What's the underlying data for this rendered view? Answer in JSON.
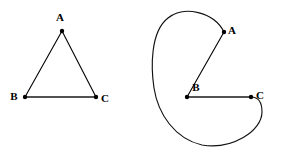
{
  "figure": {
    "background_color": "#ffffff",
    "stroke_color": "#000000",
    "caption": "",
    "panels": [
      {
        "id": "left-panel",
        "name": "triangle-graph",
        "description": "Triangle with straight edges",
        "vertices": [
          {
            "id": "A",
            "label": "A",
            "x": 62,
            "y": 31,
            "label_x": 60,
            "label_y": 18
          },
          {
            "id": "B",
            "label": "B",
            "x": 25,
            "y": 97,
            "label_x": 14,
            "label_y": 97
          },
          {
            "id": "C",
            "label": "C",
            "x": 96,
            "y": 97,
            "label_x": 105,
            "label_y": 99
          }
        ],
        "edges": [
          {
            "from": "A",
            "to": "B",
            "style": "straight"
          },
          {
            "from": "A",
            "to": "C",
            "style": "straight"
          },
          {
            "from": "B",
            "to": "C",
            "style": "straight"
          }
        ]
      },
      {
        "id": "right-panel",
        "name": "curved-graph",
        "description": "Same triangle drawn with two curved edges",
        "vertices": [
          {
            "id": "A",
            "label": "A",
            "x": 224,
            "y": 32,
            "label_x": 232,
            "label_y": 31
          },
          {
            "id": "B",
            "label": "B",
            "x": 187,
            "y": 97,
            "label_x": 196,
            "label_y": 88
          },
          {
            "id": "C",
            "label": "C",
            "x": 251,
            "y": 97,
            "label_x": 260,
            "label_y": 96
          }
        ],
        "edges": [
          {
            "from": "A",
            "to": "B",
            "style": "straight"
          },
          {
            "from": "B",
            "to": "C",
            "style": "straight"
          },
          {
            "from": "A",
            "to": "C",
            "style": "curved-loop"
          }
        ]
      }
    ]
  },
  "paths": {
    "left_AB": "M 62 31 L 25 97",
    "left_AC": "M 62 31 L 96 97",
    "left_BC": "M 25 97 L 96 97",
    "right_AB": "M 224 32 L 187 97",
    "right_BC": "M 187 97 L 251 97",
    "right_AC_curve": "M 224 32 C 214 12 184 5 168 18 C 150 32 151 68 154 88 C 158 114 175 139 202 145 C 232 150 262 131 262 112 C 262 102 258 97 251 97"
  },
  "geometry": {
    "vertex_dot_radius": 2.2,
    "label_font_size_px": 11,
    "canvas_width": 282,
    "canvas_height": 153
  }
}
